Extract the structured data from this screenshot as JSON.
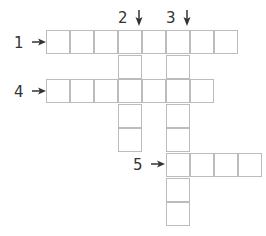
{
  "puzzle": {
    "type": "crossword",
    "cell_size": 24,
    "origin": {
      "x": 46,
      "y": 30
    },
    "colors": {
      "cell_border": "#bcbcbc",
      "cell_fill": "#ffffff",
      "label_text": "#333333"
    },
    "clues": [
      {
        "number": "1",
        "direction": "across",
        "row": 0,
        "col": 0,
        "length": 8,
        "label": "1"
      },
      {
        "number": "2",
        "direction": "down",
        "row": 0,
        "col": 3,
        "length": 5,
        "label": "2"
      },
      {
        "number": "3",
        "direction": "down",
        "row": 0,
        "col": 5,
        "length": 8,
        "label": "3"
      },
      {
        "number": "4",
        "direction": "across",
        "row": 2,
        "col": 0,
        "length": 7,
        "label": "4"
      },
      {
        "number": "5",
        "direction": "across",
        "row": 5,
        "col": 5,
        "length": 4,
        "label": "5"
      }
    ],
    "icons": {
      "across_arrow": "arrow-right-icon",
      "down_arrow": "arrow-down-icon"
    }
  }
}
